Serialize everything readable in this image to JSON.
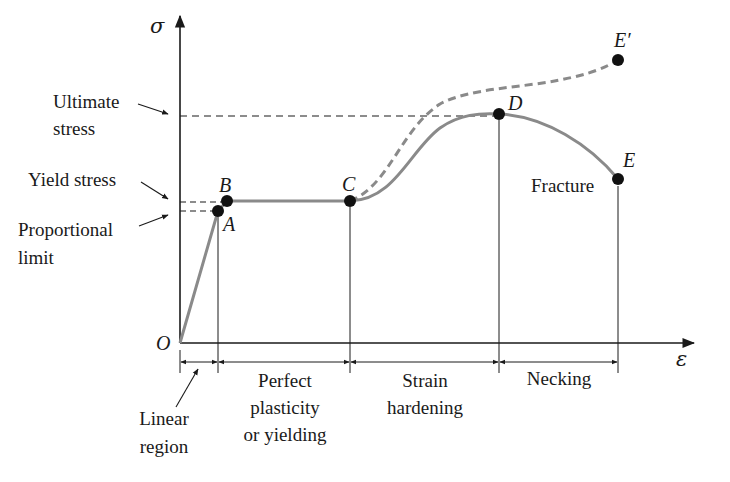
{
  "diagram": {
    "type": "stress-strain curve",
    "axes": {
      "y_label": "σ",
      "x_label": "ε",
      "origin_label": "O"
    },
    "points": [
      {
        "id": "A",
        "label": "A",
        "meaning": "Proportional limit"
      },
      {
        "id": "B",
        "label": "B",
        "meaning": "Yield stress"
      },
      {
        "id": "C",
        "label": "C",
        "meaning": "Start of strain hardening"
      },
      {
        "id": "D",
        "label": "D",
        "meaning": "Ultimate stress"
      },
      {
        "id": "E",
        "label": "E",
        "meaning": "Fracture"
      },
      {
        "id": "E_prime",
        "label": "E′",
        "meaning": "True stress-strain end"
      }
    ],
    "stress_labels": {
      "ultimate_1": "Ultimate",
      "ultimate_2": "stress",
      "yield": "Yield stress",
      "proportional_1": "Proportional",
      "proportional_2": "limit"
    },
    "fracture_label": "Fracture",
    "regions": {
      "linear_1": "Linear",
      "linear_2": "region",
      "plasticity_1": "Perfect",
      "plasticity_2": "plasticity",
      "plasticity_3": "or yielding",
      "hardening_1": "Strain",
      "hardening_2": "hardening",
      "necking": "Necking"
    },
    "colors": {
      "curve": "#8a8a8a",
      "ink": "#1a1a1a"
    }
  }
}
